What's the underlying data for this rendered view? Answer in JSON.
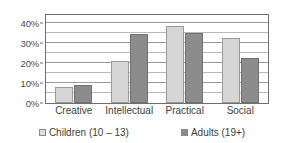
{
  "chart_data": {
    "type": "bar",
    "title": "",
    "subtitle": "",
    "xlabel": "",
    "ylabel": "",
    "categories": [
      "Creative",
      "Intellectual",
      "Practical",
      "Social"
    ],
    "series": [
      {
        "name": "Children (10 – 13)",
        "values": [
          8,
          21,
          38.5,
          32.5
        ],
        "color": "#d6d6d6"
      },
      {
        "name": "Adults  (19+)",
        "values": [
          9,
          34.5,
          35,
          22.5
        ],
        "color": "#8c8c8c"
      }
    ],
    "ylim": [
      0,
      44
    ],
    "y_tick_labels": [
      "0%",
      "10%",
      "20%",
      "30%",
      "40%"
    ],
    "y_tick_values": [
      0,
      10,
      20,
      30,
      40
    ],
    "y_minor_tick_values": [
      5,
      15,
      25,
      35
    ],
    "grid": true,
    "legend_position": "bottom",
    "annotations": []
  },
  "legend": {
    "children_label": "Children (10 – 13)",
    "adults_label": "Adults  (19+)"
  },
  "axis": {
    "tick_0": "0%",
    "tick_10": "10%",
    "tick_20": "20%",
    "tick_30": "30%",
    "tick_40": "40%"
  },
  "categories": {
    "creative": "Creative",
    "intellectual": "Intellectual",
    "practical": "Practical",
    "social": "Social"
  }
}
